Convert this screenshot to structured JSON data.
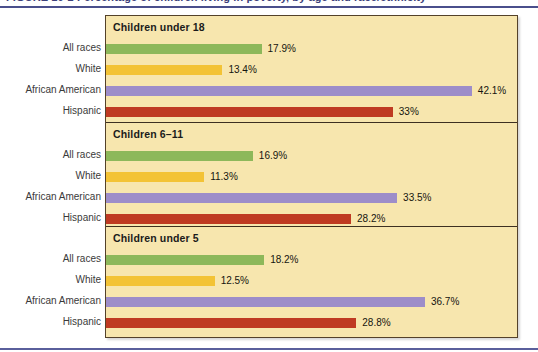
{
  "scan": {
    "clipped_header_text": "FIGURE 10-2   Percentage of children living in poverty, by age and race/ethnicity"
  },
  "chart_data": {
    "type": "bar",
    "title": "",
    "xlabel": "",
    "ylabel": "",
    "orientation": "horizontal",
    "grid": false,
    "legend": "none",
    "xlim": [
      0,
      42.1
    ],
    "value_suffix": "%",
    "categories": [
      "All races",
      "White",
      "African American",
      "Hispanic"
    ],
    "category_colors": [
      "#8db85a",
      "#f3c335",
      "#9d8dc9",
      "#bf3a22"
    ],
    "panels": [
      {
        "title": "Children under 18",
        "values": [
          17.9,
          13.4,
          42.1,
          33
        ],
        "labels": [
          "17.9%",
          "13.4%",
          "42.1%",
          "33%"
        ]
      },
      {
        "title": "Children 6–11",
        "values": [
          16.9,
          11.3,
          33.5,
          28.2
        ],
        "labels": [
          "16.9%",
          "11.3%",
          "33.5%",
          "28.2%"
        ]
      },
      {
        "title": "Children under 5",
        "values": [
          18.2,
          12.5,
          36.7,
          28.8
        ],
        "labels": [
          "18.2%",
          "12.5%",
          "36.7%",
          "28.8%"
        ]
      }
    ]
  },
  "style": {
    "panel_background": "#f7e6ae",
    "frame_border": "#54422a",
    "rule_color": "#4a4f8c"
  }
}
